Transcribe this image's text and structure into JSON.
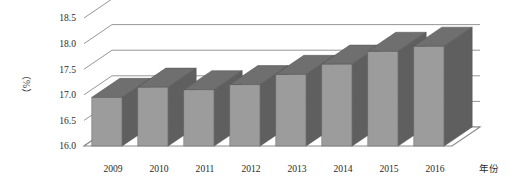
{
  "chart_data": {
    "type": "bar",
    "title": "",
    "subtitle": "",
    "xlabel": "年份",
    "ylabel": "（%）",
    "categories": [
      "2009",
      "2010",
      "2011",
      "2012",
      "2013",
      "2014",
      "2015",
      "2016"
    ],
    "values": [
      16.95,
      17.15,
      17.1,
      17.2,
      17.4,
      17.6,
      17.85,
      17.95
    ],
    "series": [
      {
        "name": "",
        "values": [
          16.95,
          17.15,
          17.1,
          17.2,
          17.4,
          17.6,
          17.85,
          17.95
        ]
      }
    ],
    "ylim": [
      16.0,
      18.5
    ],
    "ytick_labels": [
      "18.5",
      "18.0",
      "17.5",
      "17.0",
      "16.5",
      "16.0"
    ],
    "ytick_values": [
      18.5,
      18.0,
      17.5,
      17.0,
      16.5,
      16.0
    ],
    "ytick_step": 0.5,
    "grid": true,
    "grid_axis": "y",
    "legend": false,
    "legend_position": "none",
    "style": "3d-column",
    "colors": {
      "bar_front": "#9c9c9c",
      "bar_top": "#6f6f6f",
      "bar_side": "#5f5f5f",
      "grid_line": "#8a8a8a",
      "floor_fill": "#ffffff",
      "floor_line": "#8a8a8a",
      "text": "#2b2b2b",
      "background": "#ffffff"
    }
  }
}
